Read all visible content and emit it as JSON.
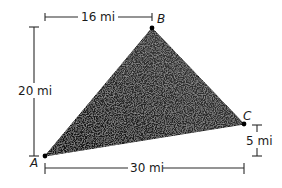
{
  "figure": {
    "type": "triangle-map",
    "colors": {
      "triangle_fill": "#2b2b2b",
      "triangle_texture": "#4a4a4a",
      "line": "#2a2a2a",
      "background": "#ffffff"
    },
    "vertices": [
      {
        "label": "A",
        "x": 45,
        "y": 156
      },
      {
        "label": "B",
        "x": 152,
        "y": 28
      },
      {
        "label": "C",
        "x": 244,
        "y": 124
      }
    ],
    "dimensions": {
      "top": "16 mi",
      "left": "20 mi",
      "bottom": "30 mi",
      "right": "5 mi"
    }
  }
}
